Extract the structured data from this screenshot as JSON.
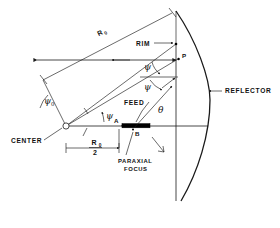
{
  "figure": {
    "background_color": "#ffffff",
    "line_color": "#1a1a1a"
  },
  "labels": {
    "center": "CENTER",
    "rim": "RIM",
    "reflector": "REFLECTOR",
    "feed": "FEED",
    "paraxial_focus_line1": "PARAXIAL",
    "paraxial_focus_line2": "FOCUS",
    "point_p": "P",
    "point_a": "A",
    "point_b": "B"
  },
  "math_labels": {
    "r_zero": "R",
    "r_zero_sub": "0",
    "r_half_numerator": "R",
    "r_half_numerator_sub": "0",
    "r_half_denominator": "2",
    "psi": "ψ",
    "psi_upper": "ψ",
    "psi_zero": "ψ",
    "psi_zero_sub": "0",
    "theta": "θ"
  },
  "annotations": {
    "psi_count": 2,
    "angle_at_center": "psi",
    "angle_at_point_p": "theta"
  },
  "caption": {
    "text": ""
  }
}
